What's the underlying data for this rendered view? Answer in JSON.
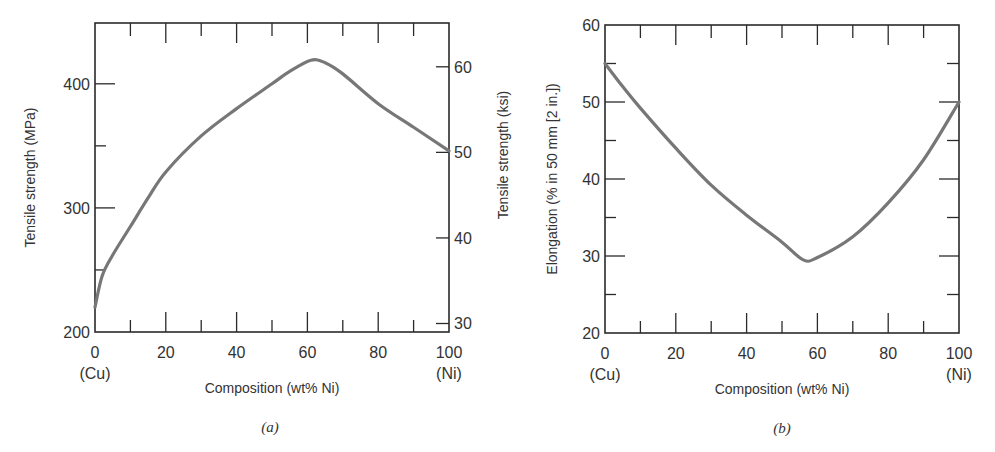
{
  "chart_data": [
    {
      "id": "a",
      "type": "line",
      "caption": "(a)",
      "xlabel": "Composition (wt% Ni)",
      "ylabel": "Tensile strength (MPa)",
      "y2label": "Tensile strength (ksi)",
      "xlim": [
        0,
        100
      ],
      "ylim": [
        200,
        449
      ],
      "y2_conversion_mpa_per_ksi": 6.895,
      "x_ticks": [
        {
          "value": 0,
          "label": "0",
          "sublabel": "(Cu)"
        },
        {
          "value": 20,
          "label": "20"
        },
        {
          "value": 40,
          "label": "40"
        },
        {
          "value": 60,
          "label": "60"
        },
        {
          "value": 80,
          "label": "80"
        },
        {
          "value": 100,
          "label": "100",
          "sublabel": "(Ni)"
        }
      ],
      "x_minor_ticks": [
        10,
        30,
        50,
        70,
        90
      ],
      "y_ticks": [
        {
          "value": 200,
          "label": "200"
        },
        {
          "value": 300,
          "label": "300"
        },
        {
          "value": 400,
          "label": "400"
        }
      ],
      "y_minor_ticks": [
        250,
        350
      ],
      "y2_ticks": [
        {
          "value": 30,
          "label": "30"
        },
        {
          "value": 40,
          "label": "40"
        },
        {
          "value": 50,
          "label": "50"
        },
        {
          "value": 60,
          "label": "60"
        }
      ],
      "grid": false,
      "series": [
        {
          "name": "Tensile strength",
          "x": [
            0,
            2,
            5,
            10,
            15,
            20,
            30,
            40,
            50,
            55,
            61,
            65,
            70,
            80,
            90,
            100
          ],
          "y": [
            220,
            245,
            262,
            285,
            308,
            329,
            358,
            380,
            400,
            410,
            419,
            417,
            408,
            384,
            365,
            346
          ]
        }
      ]
    },
    {
      "id": "b",
      "type": "line",
      "caption": "(b)",
      "xlabel": "Composition (wt% Ni)",
      "ylabel": "Elongation (% in 50 mm [2 in.])",
      "xlim": [
        0,
        100
      ],
      "ylim": [
        20,
        60
      ],
      "x_ticks": [
        {
          "value": 0,
          "label": "0",
          "sublabel": "(Cu)"
        },
        {
          "value": 20,
          "label": "20"
        },
        {
          "value": 40,
          "label": "40"
        },
        {
          "value": 60,
          "label": "60"
        },
        {
          "value": 80,
          "label": "80"
        },
        {
          "value": 100,
          "label": "100",
          "sublabel": "(Ni)"
        }
      ],
      "x_minor_ticks": [
        10,
        30,
        50,
        70,
        90
      ],
      "y_ticks": [
        {
          "value": 20,
          "label": "20"
        },
        {
          "value": 30,
          "label": "30"
        },
        {
          "value": 40,
          "label": "40"
        },
        {
          "value": 50,
          "label": "50"
        },
        {
          "value": 60,
          "label": "60"
        }
      ],
      "y_minor_ticks": [
        25,
        35,
        45,
        55
      ],
      "grid": false,
      "series": [
        {
          "name": "Elongation",
          "x": [
            0,
            5,
            10,
            20,
            30,
            40,
            50,
            56,
            60,
            70,
            80,
            90,
            100
          ],
          "y": [
            55,
            52,
            49.2,
            44,
            39.2,
            35.3,
            31.8,
            29.5,
            29.8,
            32.5,
            36.9,
            42.5,
            50
          ]
        }
      ]
    }
  ]
}
